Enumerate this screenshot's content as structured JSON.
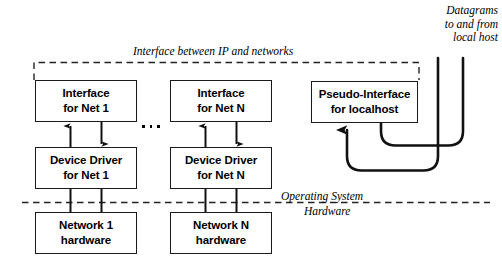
{
  "diagram": {
    "title": "Interface between IP and networks",
    "boxes": [
      {
        "id": "interface-net-1",
        "line1": "Interface",
        "line2": "for Net 1"
      },
      {
        "id": "interface-net-n",
        "line1": "Interface",
        "line2": "for Net N"
      },
      {
        "id": "pseudo-interface-localhost",
        "line1": "Pseudo-Interface",
        "line2": "for localhost"
      },
      {
        "id": "device-driver-net-1",
        "line1": "Device Driver",
        "line2": "for Net 1"
      },
      {
        "id": "device-driver-net-n",
        "line1": "Device Driver",
        "line2": "for Net N"
      },
      {
        "id": "network-1-hardware",
        "line1": "Network 1",
        "line2": "hardware"
      },
      {
        "id": "network-n-hardware",
        "line1": "Network N",
        "line2": "hardware"
      }
    ],
    "labels": {
      "interface_boundary": "Interface between IP and networks",
      "datagrams_line1": "Datagrams",
      "datagrams_line2": "to and from",
      "datagrams_line3": "local host",
      "operating_system": "Operating System",
      "hardware": "Hardware"
    },
    "colors": {
      "stroke": "#1a1a1a",
      "background": "#ffffff",
      "text": "#000000"
    }
  }
}
